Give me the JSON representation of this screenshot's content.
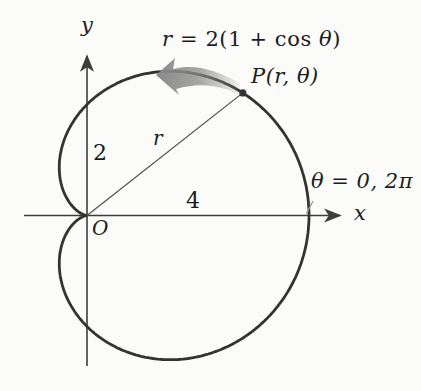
{
  "figure": {
    "equation": {
      "lhs": "r",
      "mid": " = 2(1 + cos ",
      "theta": "θ",
      "close": ")"
    },
    "point_label": "P(r, θ)",
    "radius_label": "r",
    "origin_label": "O",
    "y_segment_label": "2",
    "x_segment_label": "4",
    "theta_annotation": "θ = 0, 2π",
    "x_axis_label": "x",
    "y_axis_label": "y"
  },
  "colors": {
    "background": "#fbfbf9",
    "curve": "#333333",
    "axis": "#3d3d3d",
    "radius_line": "#4d4d4d",
    "leader_line": "#9a9a9a",
    "direction_arrow": "#8a8a8a",
    "text": "#1c1c1c"
  },
  "chart_data": {
    "type": "line",
    "coordinate_system": "polar",
    "curve_name": "cardioid",
    "equation": "r = 2(1 + cos θ)",
    "a": 2,
    "theta_range_radians": [
      0,
      6.283185307179586
    ],
    "direction": "counterclockwise",
    "x_intercept": 4,
    "y_axis_crossing": 2,
    "labeled_segments": [
      {
        "text": "4",
        "axis": "x",
        "from": 0,
        "to": 4
      },
      {
        "text": "2",
        "axis": "y",
        "from": 0,
        "to": 2
      }
    ],
    "point_P": {
      "label": "P(r, θ)",
      "theta_degrees": 38.2
    },
    "origin": {
      "label": "O",
      "x": 0,
      "y": 0
    },
    "angle_annotation": {
      "text": "θ = 0, 2π",
      "at_point": [
        4,
        0
      ]
    }
  }
}
